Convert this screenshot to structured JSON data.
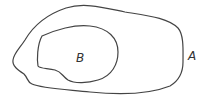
{
  "diagram": {
    "type": "set-inclusion",
    "sets": [
      {
        "id": "A",
        "label": "A",
        "contains": [
          "B"
        ]
      },
      {
        "id": "B",
        "label": "B",
        "contains": []
      }
    ],
    "stroke_color": "#444444"
  }
}
